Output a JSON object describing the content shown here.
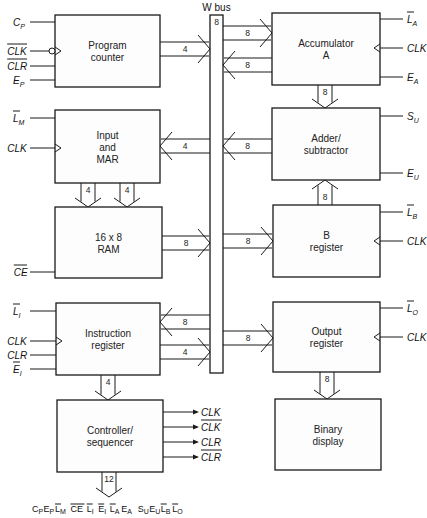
{
  "bus": {
    "title": "W bus",
    "width_label": "8",
    "x": 210,
    "y": 15,
    "w": 13,
    "h": 358
  },
  "blocks": [
    {
      "id": "program-counter",
      "lines": [
        "Program",
        "counter"
      ],
      "x": 55,
      "y": 15,
      "w": 105,
      "h": 72,
      "side": "left"
    },
    {
      "id": "input-mar",
      "lines": [
        "Input",
        "and",
        "MAR"
      ],
      "x": 55,
      "y": 110,
      "w": 105,
      "h": 73,
      "side": "left"
    },
    {
      "id": "ram",
      "lines": [
        "16 x 8",
        "RAM"
      ],
      "x": 55,
      "y": 207,
      "w": 107,
      "h": 71,
      "side": "left"
    },
    {
      "id": "instruction-register",
      "lines": [
        "Instruction",
        "register"
      ],
      "x": 56,
      "y": 303,
      "w": 104,
      "h": 72,
      "side": "left"
    },
    {
      "id": "controller-sequencer",
      "lines": [
        "Controller/",
        "sequencer"
      ],
      "x": 57,
      "y": 400,
      "w": 106,
      "h": 72,
      "side": "left"
    },
    {
      "id": "accumulator",
      "lines": [
        "Accumulator",
        "A"
      ],
      "x": 272,
      "y": 13,
      "w": 108,
      "h": 72,
      "side": "right"
    },
    {
      "id": "adder-subtractor",
      "lines": [
        "Adder/",
        "subtractor"
      ],
      "x": 272,
      "y": 108,
      "w": 108,
      "h": 72,
      "side": "right"
    },
    {
      "id": "b-register",
      "lines": [
        "B",
        "register"
      ],
      "x": 273,
      "y": 205,
      "w": 107,
      "h": 72,
      "side": "right"
    },
    {
      "id": "output-register",
      "lines": [
        "Output",
        "register"
      ],
      "x": 273,
      "y": 302,
      "w": 107,
      "h": 70,
      "side": "right"
    },
    {
      "id": "binary-display",
      "lines": [
        "Binary",
        "display"
      ],
      "x": 275,
      "y": 399,
      "w": 106,
      "h": 71,
      "side": "right"
    }
  ],
  "control_inputs": [
    {
      "block": "program-counter",
      "name": "C",
      "sub": "P",
      "bar": false,
      "y": 22,
      "clock": false
    },
    {
      "block": "program-counter",
      "name": "CLK",
      "sub": "",
      "bar": true,
      "y": 51,
      "clock": true,
      "inverted": true
    },
    {
      "block": "program-counter",
      "name": "CLR",
      "sub": "",
      "bar": true,
      "y": 66,
      "clock": false
    },
    {
      "block": "program-counter",
      "name": "E",
      "sub": "P",
      "bar": false,
      "y": 80,
      "clock": false
    },
    {
      "block": "input-mar",
      "name": "L",
      "sub": "M",
      "bar": true,
      "y": 118,
      "clock": false
    },
    {
      "block": "input-mar",
      "name": "CLK",
      "sub": "",
      "bar": false,
      "y": 148,
      "clock": true
    },
    {
      "block": "ram",
      "name": "CE",
      "sub": "",
      "bar": true,
      "y": 272,
      "clock": false
    },
    {
      "block": "instruction-register",
      "name": "L",
      "sub": "I",
      "bar": true,
      "y": 311,
      "clock": false
    },
    {
      "block": "instruction-register",
      "name": "CLK",
      "sub": "",
      "bar": false,
      "y": 341,
      "clock": true
    },
    {
      "block": "instruction-register",
      "name": "CLR",
      "sub": "",
      "bar": false,
      "y": 355,
      "clock": false
    },
    {
      "block": "instruction-register",
      "name": "E",
      "sub": "I",
      "bar": true,
      "y": 369,
      "clock": false
    },
    {
      "block": "accumulator",
      "name": "L",
      "sub": "A",
      "bar": true,
      "y": 19,
      "clock": false
    },
    {
      "block": "accumulator",
      "name": "CLK",
      "sub": "",
      "bar": false,
      "y": 48,
      "clock": true
    },
    {
      "block": "accumulator",
      "name": "E",
      "sub": "A",
      "bar": false,
      "y": 77,
      "clock": false
    },
    {
      "block": "adder-subtractor",
      "name": "S",
      "sub": "U",
      "bar": false,
      "y": 116,
      "clock": false
    },
    {
      "block": "adder-subtractor",
      "name": "E",
      "sub": "U",
      "bar": false,
      "y": 173,
      "clock": false
    },
    {
      "block": "b-register",
      "name": "L",
      "sub": "B",
      "bar": true,
      "y": 212,
      "clock": false
    },
    {
      "block": "b-register",
      "name": "CLK",
      "sub": "",
      "bar": false,
      "y": 241,
      "clock": true
    },
    {
      "block": "output-register",
      "name": "L",
      "sub": "O",
      "bar": true,
      "y": 308,
      "clock": false
    },
    {
      "block": "output-register",
      "name": "CLK",
      "sub": "",
      "bar": false,
      "y": 337,
      "clock": true
    }
  ],
  "bus_links": [
    {
      "id": "pc-to-bus",
      "label": "4",
      "from_x": 160,
      "to_x": 210,
      "y": 49,
      "dir": "right"
    },
    {
      "id": "bus-to-mar",
      "label": "4",
      "from_x": 210,
      "to_x": 160,
      "y": 146,
      "dir": "left"
    },
    {
      "id": "ram-to-bus",
      "label": "8",
      "from_x": 162,
      "to_x": 210,
      "y": 243,
      "dir": "right"
    },
    {
      "id": "bus-to-ir",
      "label": "8",
      "from_x": 210,
      "to_x": 160,
      "y": 322,
      "dir": "left"
    },
    {
      "id": "ir-to-bus",
      "label": "4",
      "from_x": 160,
      "to_x": 210,
      "y": 352,
      "dir": "right"
    },
    {
      "id": "bus-to-acc",
      "label": "8",
      "from_x": 223,
      "to_x": 272,
      "y": 33,
      "dir": "right"
    },
    {
      "id": "acc-to-bus",
      "label": "8",
      "from_x": 272,
      "to_x": 223,
      "y": 65,
      "dir": "left"
    },
    {
      "id": "adder-to-bus",
      "label": "8",
      "from_x": 272,
      "to_x": 223,
      "y": 146,
      "dir": "left"
    },
    {
      "id": "bus-to-b",
      "label": "8",
      "from_x": 223,
      "to_x": 273,
      "y": 241,
      "dir": "right"
    },
    {
      "id": "bus-to-out",
      "label": "8",
      "from_x": 223,
      "to_x": 273,
      "y": 338,
      "dir": "right"
    }
  ],
  "vertical_links": [
    {
      "id": "acc-to-adder",
      "label": "8",
      "x": 325,
      "from_y": 85,
      "to_y": 108,
      "dir": "down"
    },
    {
      "id": "mar-to-ram-1",
      "label": "4",
      "x": 88,
      "from_y": 183,
      "to_y": 207,
      "dir": "down"
    },
    {
      "id": "mar-to-ram-2",
      "label": "4",
      "x": 127,
      "from_y": 183,
      "to_y": 207,
      "dir": "down"
    },
    {
      "id": "b-to-adder",
      "label": "8",
      "x": 325,
      "from_y": 205,
      "to_y": 180,
      "dir": "up"
    },
    {
      "id": "ir-to-controller",
      "label": "4",
      "x": 108,
      "from_y": 375,
      "to_y": 400,
      "dir": "down"
    },
    {
      "id": "out-to-display",
      "label": "8",
      "x": 327,
      "from_y": 372,
      "to_y": 399,
      "dir": "down"
    },
    {
      "id": "controller-control-word",
      "label": "12",
      "x": 109,
      "from_y": 472,
      "to_y": 497,
      "dir": "down"
    }
  ],
  "controller_outputs": [
    {
      "name": "CLK",
      "bar": false,
      "y": 412
    },
    {
      "name": "CLK",
      "bar": true,
      "y": 427
    },
    {
      "name": "CLR",
      "bar": false,
      "y": 442
    },
    {
      "name": "CLR",
      "bar": true,
      "y": 457
    }
  ],
  "control_word": {
    "text": "CPEPLMCE LIEILAEA SUEULBLO",
    "signals": [
      {
        "name": "C",
        "sub": "P",
        "bar": false
      },
      {
        "name": "E",
        "sub": "P",
        "bar": false
      },
      {
        "name": "L",
        "sub": "M",
        "bar": true
      },
      {
        "name": "CE",
        "sub": "",
        "bar": true
      },
      {
        "name": "L",
        "sub": "I",
        "bar": true
      },
      {
        "name": "E",
        "sub": "I",
        "bar": true
      },
      {
        "name": "L",
        "sub": "A",
        "bar": true
      },
      {
        "name": "E",
        "sub": "A",
        "bar": false
      },
      {
        "name": "S",
        "sub": "U",
        "bar": false
      },
      {
        "name": "E",
        "sub": "U",
        "bar": false
      },
      {
        "name": "L",
        "sub": "B",
        "bar": true
      },
      {
        "name": "L",
        "sub": "O",
        "bar": true
      }
    ],
    "x": 32,
    "y": 512
  }
}
